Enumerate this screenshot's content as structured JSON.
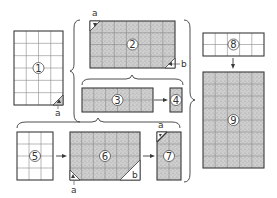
{
  "diagram": {
    "colors": {
      "stroke": "#3a3a3a",
      "grid": "#8a8a8a",
      "white_fill": "#ffffff",
      "stipple_fill": "#c9c9c9"
    },
    "panels": [
      {
        "id": "1",
        "label": "1",
        "fill": "white",
        "cols": 4,
        "rows": 6,
        "x": 14,
        "y": 31,
        "w": 49,
        "h": 74
      },
      {
        "id": "2",
        "label": "2",
        "fill": "stipple",
        "cols": 7,
        "rows": 4,
        "x": 90,
        "y": 21,
        "w": 85,
        "h": 47
      },
      {
        "id": "3",
        "label": "3",
        "fill": "stipple",
        "cols": 6,
        "rows": 2,
        "x": 82,
        "y": 88,
        "w": 71,
        "h": 24
      },
      {
        "id": "4",
        "label": "4",
        "fill": "stipple",
        "cols": 1,
        "rows": 2,
        "x": 170,
        "y": 88,
        "w": 12,
        "h": 24
      },
      {
        "id": "5",
        "label": "5",
        "fill": "white",
        "cols": 3,
        "rows": 4,
        "x": 17,
        "y": 132,
        "w": 36,
        "h": 48
      },
      {
        "id": "6",
        "label": "6",
        "fill": "stipple",
        "cols": 6,
        "rows": 4,
        "x": 70,
        "y": 132,
        "w": 70,
        "h": 48
      },
      {
        "id": "7",
        "label": "7",
        "fill": "stipple",
        "cols": 2,
        "rows": 4,
        "x": 157,
        "y": 132,
        "w": 24,
        "h": 48
      },
      {
        "id": "8",
        "label": "8",
        "fill": "white",
        "cols": 5,
        "rows": 2,
        "x": 203,
        "y": 33,
        "w": 61,
        "h": 23
      },
      {
        "id": "9",
        "label": "9",
        "fill": "stipple",
        "cols": 5,
        "rows": 8,
        "x": 203,
        "y": 72,
        "w": 61,
        "h": 96
      }
    ],
    "corner_labels": {
      "p1_a": "a",
      "p2_a": "a",
      "p2_b": "b",
      "p6_a": "a",
      "p6_b": "b",
      "p7_a": "a"
    },
    "arrows": [
      {
        "from": "3",
        "to": "4"
      },
      {
        "from": "5",
        "to": "6"
      },
      {
        "from": "6",
        "to": "7"
      },
      {
        "from": "8",
        "to": "9"
      }
    ]
  }
}
